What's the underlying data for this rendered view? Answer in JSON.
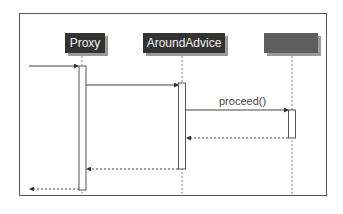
{
  "diagram": {
    "type": "sequence",
    "participants": [
      {
        "name": "Proxy",
        "x": 82
      },
      {
        "name": "AroundAdvice",
        "x": 182
      },
      {
        "name": "",
        "x": 292,
        "note": "label illegible"
      }
    ],
    "messages": [
      {
        "from": "external",
        "to": "Proxy",
        "label": "",
        "style": "solid"
      },
      {
        "from": "Proxy",
        "to": "AroundAdvice",
        "label": "",
        "style": "solid"
      },
      {
        "from": "AroundAdvice",
        "to": "target",
        "label": "proceed()",
        "style": "solid"
      },
      {
        "from": "target",
        "to": "AroundAdvice",
        "label": "",
        "style": "dashed"
      },
      {
        "from": "AroundAdvice",
        "to": "Proxy",
        "label": "",
        "style": "dashed"
      },
      {
        "from": "Proxy",
        "to": "external",
        "label": "",
        "style": "dashed"
      }
    ]
  }
}
